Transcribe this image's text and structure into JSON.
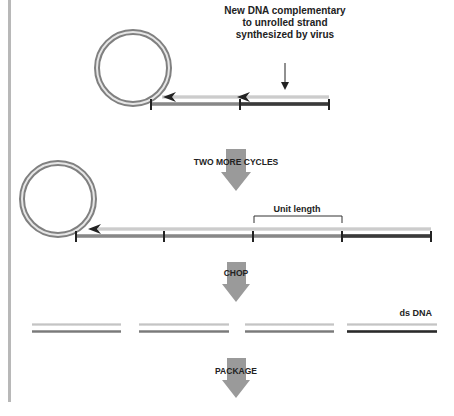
{
  "annotation": {
    "line1": "New DNA complementary",
    "line2": "to unrolled strand",
    "line3": "synthesized by virus"
  },
  "steps": {
    "step1": "TWO MORE CYCLES",
    "step2": "CHOP",
    "step3": "PACKAGE"
  },
  "unit_length_label": "Unit length",
  "ds_dna_label": "ds DNA",
  "colors": {
    "arrow": "#9a9a9a",
    "circle_outer": "#7a7a7a",
    "circle_inner": "#e8e8e8",
    "strand_light": "#cfcfcf",
    "strand_mid": "#8c8c8c",
    "strand_dark": "#3a3a3a",
    "left_bar": "#b5b5b5"
  }
}
